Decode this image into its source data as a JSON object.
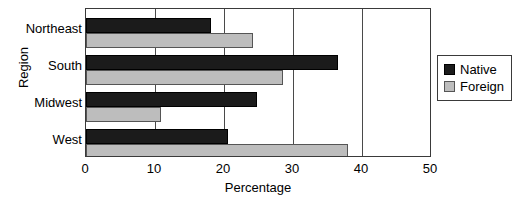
{
  "chart_data": {
    "type": "bar",
    "orientation": "horizontal",
    "title": "",
    "xlabel": "Percentage",
    "ylabel": "Region",
    "categories": [
      "Northeast",
      "South",
      "Midwest",
      "West"
    ],
    "series": [
      {
        "name": "Native",
        "color": "#1b1b1b",
        "values": [
          18.2,
          36.7,
          24.9,
          20.7
        ]
      },
      {
        "name": "Foreign",
        "color": "#bdbdbd",
        "values": [
          24.3,
          28.6,
          10.9,
          38.1
        ]
      }
    ],
    "xlim": [
      0,
      50
    ],
    "xticks": [
      0,
      10,
      20,
      30,
      40,
      50
    ],
    "xtick_labels": [
      "0",
      "10",
      "20",
      "30",
      "40",
      "50"
    ],
    "grid": true,
    "grid_axis": "x",
    "legend_position": "right",
    "legend_entries": [
      "Native",
      "Foreign"
    ]
  },
  "axes": {
    "y_title": "Region",
    "x_title": "Percentage"
  },
  "legend": {
    "native_label": "Native",
    "foreign_label": "Foreign"
  },
  "categories": {
    "0": "Northeast",
    "1": "South",
    "2": "Midwest",
    "3": "West"
  },
  "xticks": {
    "0": "0",
    "1": "10",
    "2": "20",
    "3": "30",
    "4": "40",
    "5": "50"
  }
}
